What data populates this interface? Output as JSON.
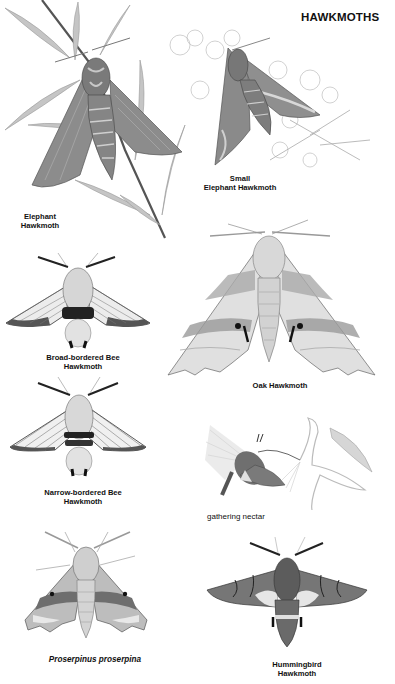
{
  "page": {
    "title": "HAWKMOTHS",
    "background": "#ffffff",
    "ink": "#111111"
  },
  "plates": [
    {
      "id": "elephant",
      "caption_line1": "Elephant",
      "caption_line2": "Hawkmoth",
      "style": "bold"
    },
    {
      "id": "small-elephant",
      "caption_line1": "Small",
      "caption_line2": "Elephant Hawkmoth",
      "style": "bold"
    },
    {
      "id": "broad-bordered-bee",
      "caption_line1": "Broad-bordered Bee",
      "caption_line2": "Hawkmoth",
      "style": "bold"
    },
    {
      "id": "oak",
      "caption_line1": "Oak Hawkmoth",
      "style": "bold"
    },
    {
      "id": "narrow-bordered-bee",
      "caption_line1": "Narrow-bordered Bee",
      "caption_line2": "Hawkmoth",
      "style": "bold"
    },
    {
      "id": "gathering-nectar",
      "caption_line1": "gathering nectar",
      "style": "plain"
    },
    {
      "id": "proserpinus",
      "caption_line1": "Proserpinus proserpina",
      "style": "bold-italic"
    },
    {
      "id": "hummingbird",
      "caption_line1": "Hummingbird",
      "caption_line2": "Hawkmoth",
      "style": "bold"
    }
  ],
  "colors": {
    "wing_dark": "#6b6b6b",
    "wing_mid": "#9a9a9a",
    "wing_light": "#d4d4d4",
    "leaf": "#b8b8b8",
    "flower": "#c9c9c9"
  }
}
